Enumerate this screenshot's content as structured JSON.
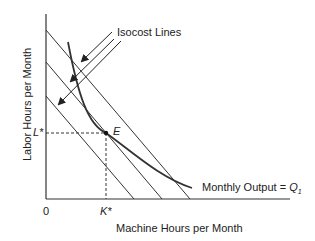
{
  "diagram": {
    "title": "",
    "ylabel": "Labor Hours per Month",
    "xlabel": "Machine Hours per Month",
    "origin_label": "0",
    "annotations": {
      "isocost": "Isocost Lines",
      "output_prefix": "Monthly Output = ",
      "output_q": "Q",
      "output_sub": "1",
      "equilibrium": "E",
      "l_star": "L*",
      "k_star": "K*"
    },
    "elements": {
      "isocost_lines": 3,
      "isoquant_curves": 1,
      "arrows": 3
    }
  }
}
